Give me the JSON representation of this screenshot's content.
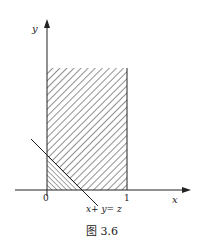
{
  "figure": {
    "caption": "图 3.6",
    "axes": {
      "x_label": "x",
      "y_label": "y",
      "x_ticks": [
        "0",
        "1"
      ]
    },
    "line_label": "x+ y= z",
    "regions": [
      {
        "name": "rectangle",
        "description": "0 ≤ x ≤ 1, y ≥ 0 (hatched ///)"
      },
      {
        "name": "triangle",
        "description": "x + y ≤ z inside rectangle (hatched \\\\\\)"
      }
    ],
    "colors": {
      "ink": "#222222",
      "background": "#ffffff"
    }
  }
}
